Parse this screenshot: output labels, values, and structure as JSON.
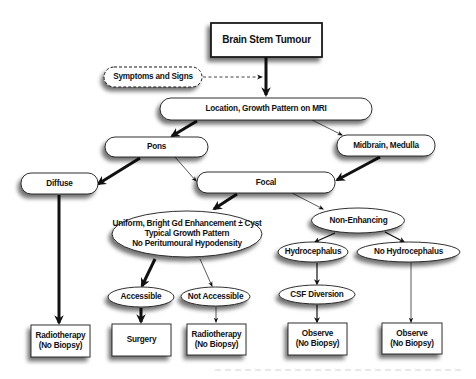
{
  "diagram": {
    "title": "Brain Stem Tumour",
    "nodes": {
      "root": {
        "label": "Brain Stem Tumour",
        "shape": "rect"
      },
      "symptoms": {
        "label": "Symptoms and Signs",
        "shape": "rounded-dashed"
      },
      "location": {
        "label": "Location, Growth Pattern on MRI",
        "shape": "rounded"
      },
      "pons": {
        "label": "Pons",
        "shape": "rounded"
      },
      "midbrain": {
        "label": "Midbrain, Medulla",
        "shape": "rounded"
      },
      "diffuse": {
        "label": "Diffuse",
        "shape": "rounded"
      },
      "focal": {
        "label": "Focal",
        "shape": "rounded"
      },
      "uniform": {
        "shape": "ellipse",
        "lines": [
          "Uniform, Bright Gd Enhancement ± Cyst",
          "Typical Growth Pattern",
          "No Peritumoural Hypodensity"
        ]
      },
      "non_enhancing": {
        "label": "Non-Enhancing",
        "shape": "ellipse"
      },
      "hydrocephalus": {
        "label": "Hydrocephalus",
        "shape": "ellipse"
      },
      "no_hydrocephalus": {
        "label": "No Hydrocephalus",
        "shape": "ellipse"
      },
      "accessible": {
        "label": "Accessible",
        "shape": "ellipse"
      },
      "not_accessible": {
        "label": "Not Accessible",
        "shape": "ellipse"
      },
      "csf_diversion": {
        "label": "CSF Diversion",
        "shape": "ellipse"
      },
      "radio1": {
        "lines": [
          "Radiotherapy",
          "(No Biopsy)"
        ],
        "shape": "rect"
      },
      "surgery": {
        "label": "Surgery",
        "shape": "rect"
      },
      "radio2": {
        "lines": [
          "Radiotherapy",
          "(No Biopsy)"
        ],
        "shape": "rect"
      },
      "observe1": {
        "lines": [
          "Observe",
          "(No Biopsy)"
        ],
        "shape": "rect"
      },
      "observe2": {
        "lines": [
          "Observe",
          "(No Biopsy)"
        ],
        "shape": "rect"
      }
    },
    "edges": [
      {
        "from": "root",
        "to": "location",
        "weight": "thick"
      },
      {
        "from": "symptoms",
        "to": "root-edge",
        "weight": "dashed"
      },
      {
        "from": "location",
        "to": "pons",
        "weight": "thick"
      },
      {
        "from": "location",
        "to": "midbrain",
        "weight": "thin"
      },
      {
        "from": "pons",
        "to": "diffuse",
        "weight": "thick"
      },
      {
        "from": "pons",
        "to": "focal",
        "weight": "thin"
      },
      {
        "from": "midbrain",
        "to": "focal",
        "weight": "thick"
      },
      {
        "from": "diffuse",
        "to": "radio1",
        "weight": "thick"
      },
      {
        "from": "focal",
        "to": "uniform",
        "weight": "thick"
      },
      {
        "from": "focal",
        "to": "non_enhancing",
        "weight": "thin"
      },
      {
        "from": "uniform",
        "to": "accessible",
        "weight": "thick"
      },
      {
        "from": "uniform",
        "to": "not_accessible",
        "weight": "thin"
      },
      {
        "from": "accessible",
        "to": "surgery",
        "weight": "thick"
      },
      {
        "from": "not_accessible",
        "to": "radio2",
        "weight": "thin"
      },
      {
        "from": "non_enhancing",
        "to": "hydrocephalus",
        "weight": "medium"
      },
      {
        "from": "non_enhancing",
        "to": "no_hydrocephalus",
        "weight": "medium"
      },
      {
        "from": "hydrocephalus",
        "to": "csf_diversion",
        "weight": "medium"
      },
      {
        "from": "csf_diversion",
        "to": "observe1",
        "weight": "medium"
      },
      {
        "from": "no_hydrocephalus",
        "to": "observe2",
        "weight": "thin"
      }
    ]
  },
  "colors": {
    "stroke": "#1a1a1a",
    "fill": "#ffffff",
    "shadow": "#9a9a9a",
    "text": "#111111"
  }
}
